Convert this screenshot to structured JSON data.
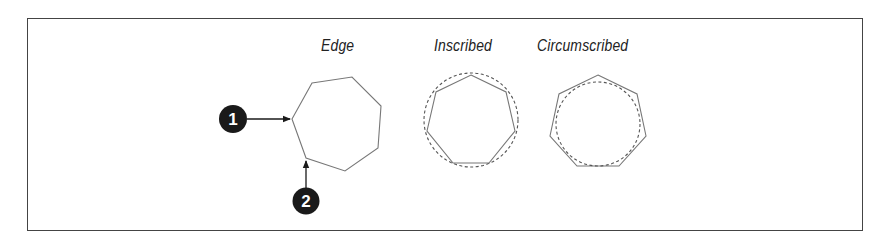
{
  "figure": {
    "labels": {
      "edge": "Edge",
      "inscribed": "Inscribed",
      "circumscribed": "Circumscribed"
    },
    "callouts": [
      {
        "number": "1",
        "target": "vertex"
      },
      {
        "number": "2",
        "target": "vertex"
      }
    ],
    "colors": {
      "frame": "#444444",
      "polygon_stroke": "#777777",
      "circle_dash": "#555555",
      "callout_fill": "#1a1a1a",
      "label_text": "#222222"
    }
  }
}
